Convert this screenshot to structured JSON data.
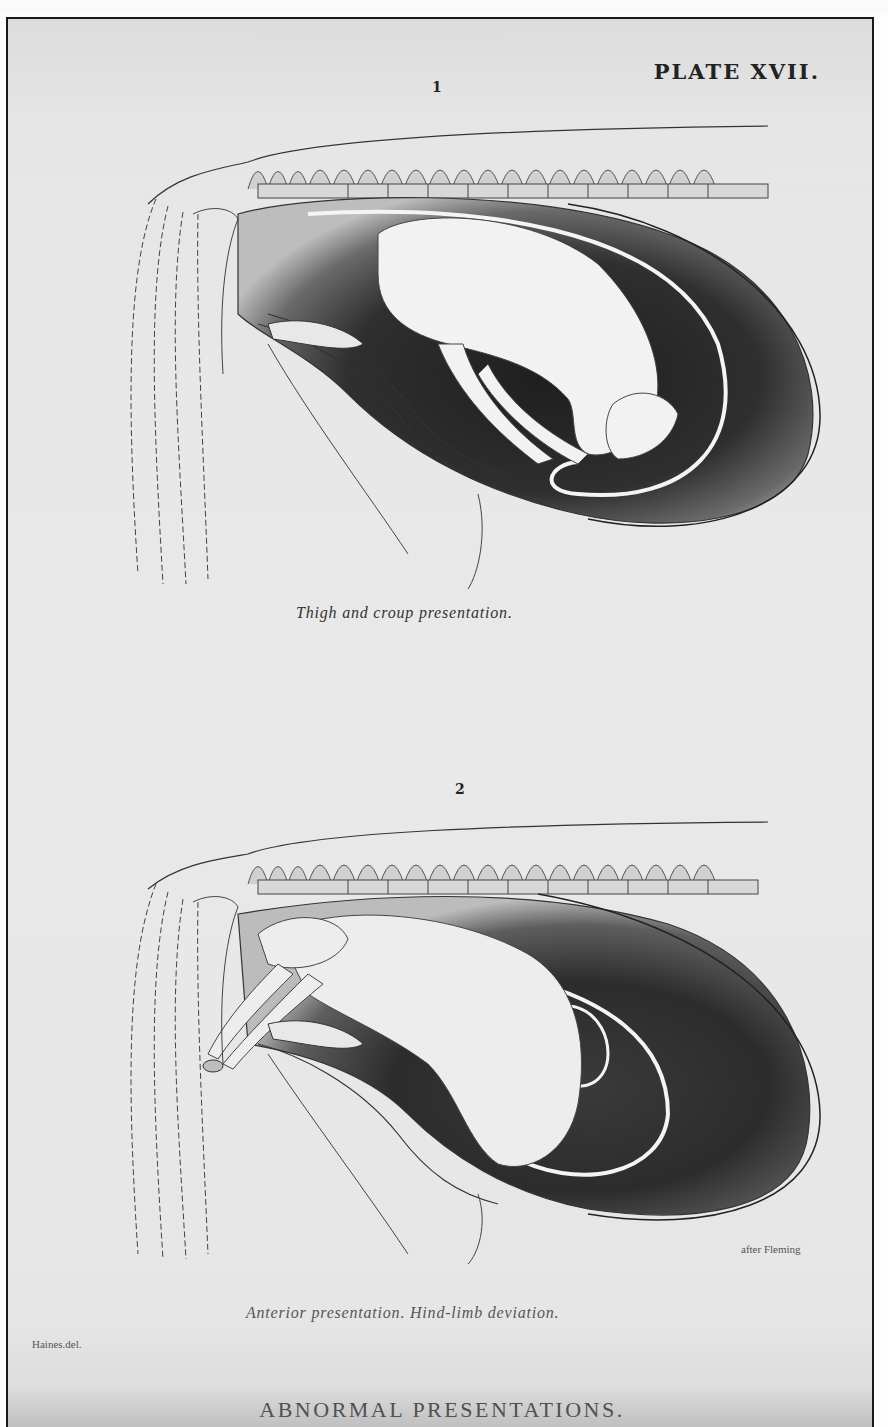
{
  "plate": {
    "title": "PLATE XVII.",
    "footer_title": "ABNORMAL PRESENTATIONS.",
    "artist_credit": "Haines.del."
  },
  "figures": [
    {
      "number": "1",
      "caption": "Thigh and croup presentation.",
      "illustration": "foal-thigh-and-croup-presentation"
    },
    {
      "number": "2",
      "caption": "Anterior presentation. Hind-limb deviation.",
      "source_credit": "after Fleming",
      "illustration": "foal-anterior-presentation-hind-limb-deviation"
    }
  ],
  "colors": {
    "paper": "#e8e8e8",
    "ink": "#1a1a1a",
    "stipple_dark": "#2a2a2a",
    "frame_border": "#1a1a1a"
  }
}
